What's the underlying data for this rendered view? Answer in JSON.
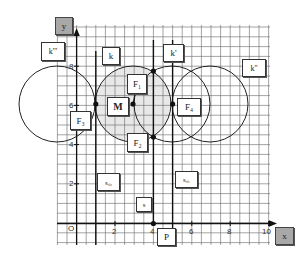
{
  "diagram": {
    "axes": {
      "x_label": "x",
      "y_label": "y",
      "origin_label": "O",
      "x_ticks": [
        "2",
        "4",
        "6",
        "8",
        "10"
      ],
      "y_ticks": [
        "2",
        "4",
        "6",
        "8"
      ]
    },
    "labels": {
      "k": "k",
      "k1": "k'",
      "k2": "k''",
      "k3": "k'''",
      "M": "M",
      "F1": "F₁",
      "F2": "F₂",
      "F3": "F₃",
      "F4": "F₄",
      "P": "P",
      "s": "s",
      "sc1": "s꜀₁",
      "sc2": "s꜀₂"
    },
    "colors": {
      "grid": "#555555",
      "lines": "#111111",
      "shade": "#e6e6e6",
      "axis_box": "#a8a8a8"
    }
  }
}
